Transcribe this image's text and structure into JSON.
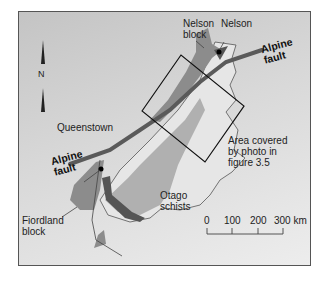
{
  "map": {
    "labels": {
      "nelson_block": [
        "Nelson",
        "block"
      ],
      "nelson": "Nelson",
      "alpine_fault_ne": [
        "Alpine",
        "fault"
      ],
      "alpine_fault_sw": [
        "Alpine",
        "fault"
      ],
      "queenstown": "Queenstown",
      "area_covered": [
        "Area covered",
        "by photo in",
        "figure 3.5"
      ],
      "otago_schists": [
        "Otago",
        "schists"
      ],
      "fiordland_block": [
        "Fiordland",
        "block"
      ]
    },
    "north_arrow": {
      "label": "N",
      "icon": "north-arrow-icon"
    },
    "scale_bar": {
      "ticks": [
        "0",
        "100",
        "200",
        "300 km"
      ]
    },
    "colors": {
      "background_dark": "#c4c4c4",
      "background_light": "#ededed",
      "land_light": "#e6e6e6",
      "schist": "#b0b0b0",
      "block": "#8c8c8c",
      "belt_dark": "#555555",
      "fault": "#5a5a5a"
    }
  }
}
